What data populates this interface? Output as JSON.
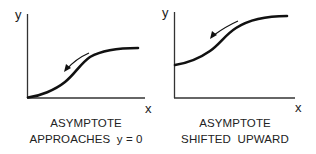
{
  "panels": [
    {
      "id": "left",
      "axis_labels": {
        "y": "y",
        "x": "x"
      },
      "caption": {
        "line1": "ASYMPTOTE",
        "line2": "APPROACHES  y = 0"
      },
      "curve": "sigmoid starting at origin (asymptote y = 0), rising to plateau",
      "arrow_direction": "down-left along curve"
    },
    {
      "id": "right",
      "axis_labels": {
        "y": "y",
        "x": "x"
      },
      "caption": {
        "line1": "ASYMPTOTE",
        "line2": "SHIFTED  UPWARD"
      },
      "curve": "sigmoid starting above origin (lower asymptote shifted up), rising to plateau",
      "arrow_direction": "down-left along curve"
    }
  ],
  "colors": {
    "ink": "#111111",
    "axis": "#333333",
    "background": "#ffffff"
  }
}
